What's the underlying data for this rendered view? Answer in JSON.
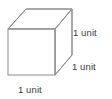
{
  "figure": {
    "name": "unit-cube",
    "shape": "cube",
    "projection": "oblique",
    "background_color": "#ffffff",
    "edge_color": "#8c8c8c",
    "face_color": "#ffffff",
    "label_color": "#3b3b3b",
    "labels": {
      "height": "1 unit",
      "depth": "1 unit",
      "width": "1 unit"
    }
  }
}
